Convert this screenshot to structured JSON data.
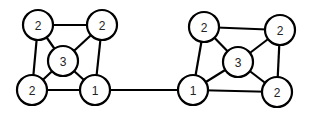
{
  "diagram": {
    "type": "graph",
    "node_radius": 15,
    "nodes": [
      {
        "id": "L_tl",
        "label": "2",
        "x": 38,
        "y": 25
      },
      {
        "id": "L_tr",
        "label": "2",
        "x": 102,
        "y": 25
      },
      {
        "id": "L_c",
        "label": "3",
        "x": 63,
        "y": 61
      },
      {
        "id": "L_bl",
        "label": "2",
        "x": 32,
        "y": 90
      },
      {
        "id": "L_br",
        "label": "1",
        "x": 95,
        "y": 90
      },
      {
        "id": "R_tl",
        "label": "2",
        "x": 204,
        "y": 27
      },
      {
        "id": "R_tr",
        "label": "2",
        "x": 280,
        "y": 30
      },
      {
        "id": "R_c",
        "label": "3",
        "x": 238,
        "y": 62
      },
      {
        "id": "R_bl",
        "label": "1",
        "x": 193,
        "y": 90
      },
      {
        "id": "R_br",
        "label": "2",
        "x": 277,
        "y": 92
      }
    ],
    "edges": [
      [
        "L_tl",
        "L_tr"
      ],
      [
        "L_tl",
        "L_bl"
      ],
      [
        "L_tl",
        "L_c"
      ],
      [
        "L_tr",
        "L_c"
      ],
      [
        "L_tr",
        "L_br"
      ],
      [
        "L_c",
        "L_bl"
      ],
      [
        "L_c",
        "L_br"
      ],
      [
        "L_bl",
        "L_br"
      ],
      [
        "L_br",
        "R_bl"
      ],
      [
        "R_tl",
        "R_tr"
      ],
      [
        "R_tl",
        "R_bl"
      ],
      [
        "R_tl",
        "R_c"
      ],
      [
        "R_tr",
        "R_c"
      ],
      [
        "R_tr",
        "R_br"
      ],
      [
        "R_c",
        "R_bl"
      ],
      [
        "R_c",
        "R_br"
      ],
      [
        "R_bl",
        "R_br"
      ]
    ]
  }
}
